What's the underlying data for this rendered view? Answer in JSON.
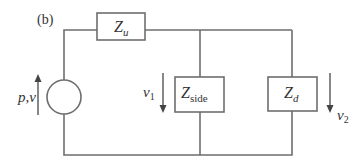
{
  "figure_label": "(b)",
  "components": {
    "source": {
      "label": "p,v",
      "type": "source"
    },
    "z_u": {
      "symbol": "Z",
      "subscript": "u"
    },
    "z_side": {
      "symbol": "Z",
      "subscript": "side"
    },
    "z_d": {
      "symbol": "Z",
      "subscript": "d"
    }
  },
  "quantities": {
    "v1": {
      "symbol": "v",
      "subscript": "1",
      "direction": "down"
    },
    "v2": {
      "symbol": "v",
      "subscript": "2",
      "direction": "down"
    },
    "source_arrow": {
      "direction": "up"
    }
  },
  "colors": {
    "wire": "#6e6e6e",
    "text": "#333333"
  }
}
